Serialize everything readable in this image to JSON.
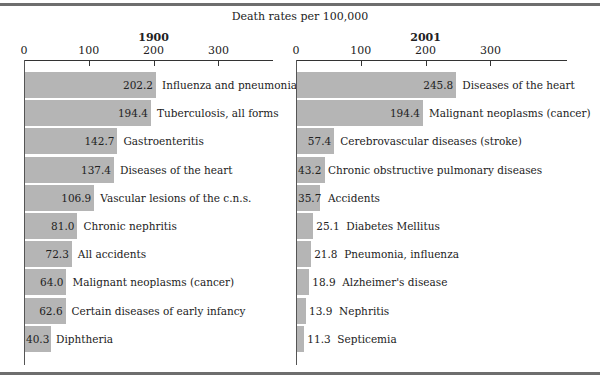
{
  "title": "Death rates per 100,000",
  "colors": {
    "bar": "#b5b5b5",
    "rule": "#6e6e6e",
    "axis": "#333333"
  },
  "chart_data": [
    {
      "type": "bar",
      "orientation": "horizontal",
      "title": "1900",
      "xlabel": "Death rates per 100,000",
      "xticks": [
        0,
        100,
        200,
        300
      ],
      "xlim": [
        0,
        380
      ],
      "categories": [
        "Influenza and pneumonia",
        "Tuberculosis, all forms",
        "Gastroenteritis",
        "Diseases of the heart",
        "Vascular lesions of the c.n.s.",
        "Chronic nephritis",
        "All accidents",
        "Malignant neoplasms (cancer)",
        "Certain diseases of early infancy",
        "Diphtheria"
      ],
      "values": [
        202.2,
        194.4,
        142.7,
        137.4,
        106.9,
        81.0,
        72.3,
        64.0,
        62.6,
        40.3
      ],
      "value_labels": [
        "202.2",
        "194.4",
        "142.7",
        "137.4",
        "106.9",
        "81.0",
        "72.3",
        "64.0",
        "62.6",
        "40.3"
      ]
    },
    {
      "type": "bar",
      "orientation": "horizontal",
      "title": "2001",
      "xlabel": "Death rates per 100,000",
      "xticks": [
        0,
        100,
        200,
        300
      ],
      "xlim": [
        0,
        380
      ],
      "categories": [
        "Diseases of the heart",
        "Malignant neoplasms (cancer)",
        "Cerebrovascular diseases (stroke)",
        "Chronic obstructive pulmonary diseases",
        "Accidents",
        "Diabetes Mellitus",
        "Pneumonia, influenza",
        "Alzheimer's disease",
        "Nephritis",
        "Septicemia"
      ],
      "values": [
        245.8,
        194.4,
        57.4,
        43.2,
        35.7,
        25.1,
        21.8,
        18.9,
        13.9,
        11.3
      ],
      "value_labels": [
        "245.8",
        "194.4",
        "57.4",
        "43.2",
        "35.7",
        "25.1",
        "21.8",
        "18.9",
        "13.9",
        "11.3"
      ]
    }
  ]
}
